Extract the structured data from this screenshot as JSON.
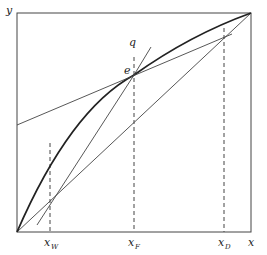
{
  "diagram": {
    "type": "McCabe-Thiele x-y diagram",
    "axes": {
      "y_label": "y",
      "x_label": "x"
    },
    "points": {
      "intersection_label": "e",
      "q_line_label": "q"
    },
    "x_markers": [
      {
        "label": "x",
        "sub": "W"
      },
      {
        "label": "x",
        "sub": "F"
      },
      {
        "label": "x",
        "sub": "D"
      }
    ],
    "lines": [
      "diagonal y=x",
      "equilibrium curve",
      "rectifying operating line",
      "stripping operating line",
      "q-line"
    ],
    "colors": {
      "line": "#333333",
      "background": "#ffffff"
    }
  }
}
